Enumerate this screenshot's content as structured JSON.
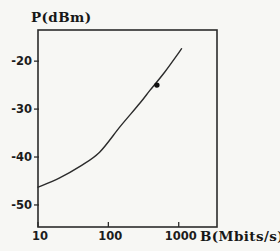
{
  "figure": {
    "background": "#f7f7f4",
    "ink": "#2b2b2b",
    "point_color": "#111111"
  },
  "chart_data": {
    "type": "line",
    "title": "",
    "xlabel": "B(Mbits/s)",
    "ylabel": "P(dBm)",
    "x_scale": "log",
    "y_scale": "linear",
    "xlim": [
      10,
      3500
    ],
    "ylim": [
      -54.6,
      -13.5
    ],
    "x_ticks": [
      10,
      100,
      1000
    ],
    "x_tick_labels": [
      "10",
      "100",
      "1000"
    ],
    "y_ticks": [
      -20,
      -30,
      -40,
      -50
    ],
    "y_tick_labels": [
      "-20",
      "-30",
      "-40",
      "-50"
    ],
    "grid": false,
    "legend": "none",
    "series": [
      {
        "name": "sensitivity-curve",
        "type": "line",
        "x": [
          10,
          20,
          40,
          75,
          150,
          280,
          390,
          630,
          1100
        ],
        "y": [
          -46.3,
          -44.4,
          -41.9,
          -39.0,
          -33.5,
          -28.8,
          -26.1,
          -22.3,
          -17.4
        ]
      },
      {
        "name": "measured-data-point",
        "type": "scatter",
        "x": [
          490
        ],
        "y": [
          -25
        ]
      }
    ]
  }
}
